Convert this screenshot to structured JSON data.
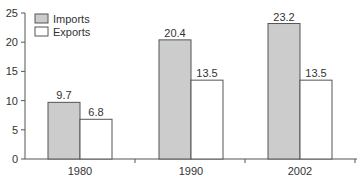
{
  "chart_data": {
    "type": "bar",
    "title": "",
    "xlabel": "",
    "ylabel": "",
    "categories": [
      "1980",
      "1990",
      "2002"
    ],
    "series": [
      {
        "name": "Imports",
        "values": [
          9.7,
          20.4,
          23.2
        ],
        "color": "#cccccc"
      },
      {
        "name": "Exports",
        "values": [
          6.8,
          13.5,
          13.5
        ],
        "color": "#ffffff"
      }
    ],
    "ylim": [
      0,
      25
    ],
    "yticks": [
      0,
      5,
      10,
      15,
      20,
      25
    ],
    "data_labels": true,
    "grid": false,
    "legend": "top-left"
  }
}
